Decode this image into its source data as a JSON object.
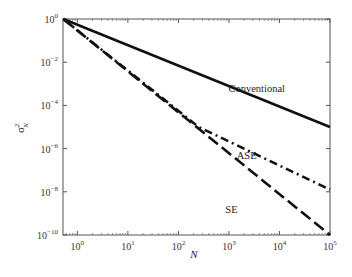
{
  "chart_data": {
    "type": "line",
    "title": "",
    "xlabel": "N",
    "ylabel": "σ²_N",
    "xscale": "log",
    "yscale": "log",
    "xlim": [
      0.52,
      100000
    ],
    "ylim": [
      1e-10,
      1
    ],
    "grid": false,
    "legend": "inline labels",
    "x_ticks": [
      {
        "exp": "0",
        "value": 1
      },
      {
        "exp": "1",
        "value": 10
      },
      {
        "exp": "2",
        "value": 100
      },
      {
        "exp": "3",
        "value": 1000
      },
      {
        "exp": "4",
        "value": 10000
      },
      {
        "exp": "5",
        "value": 100000
      }
    ],
    "y_ticks": [
      {
        "exp": "0",
        "value": 1
      },
      {
        "exp": "−2",
        "value": 0.01
      },
      {
        "exp": "−4",
        "value": 0.0001
      },
      {
        "exp": "−6",
        "value": 1e-06
      },
      {
        "exp": "−8",
        "value": 1e-08
      },
      {
        "exp": "−10",
        "value": 1e-10
      }
    ],
    "series": [
      {
        "name": "Conventional",
        "style": "solid",
        "points_log10": [
          [
            -0.28,
            0
          ],
          [
            5,
            -5.0
          ]
        ]
      },
      {
        "name": "ASE",
        "style": "dash-dot",
        "points_log10": [
          [
            -0.28,
            0
          ],
          [
            2.4,
            -5.0
          ],
          [
            5,
            -7.9
          ]
        ]
      },
      {
        "name": "SE",
        "style": "dashed",
        "points_log10": [
          [
            -0.28,
            0
          ],
          [
            5,
            -10
          ]
        ]
      }
    ],
    "annotations": [
      {
        "text": "Conventional",
        "x_log10": 3.55,
        "y_log10": -3.4
      },
      {
        "text": "ASE",
        "x_log10": 3.35,
        "y_log10": -6.5
      },
      {
        "text": "SE",
        "x_log10": 3.05,
        "y_log10": -9.0
      }
    ]
  },
  "labels": {
    "base": "10",
    "x_axis_label": "N",
    "y_axis_sigma": "σ",
    "y_axis_sup": "2",
    "y_axis_sub": "N",
    "conventional": "Conventional",
    "ase": "ASE",
    "se": "SE"
  }
}
